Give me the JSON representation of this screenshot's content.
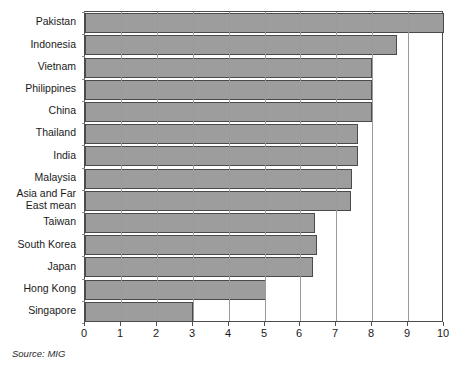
{
  "chart_data": {
    "type": "bar",
    "orientation": "horizontal",
    "title": "",
    "subtitle": "",
    "xlabel": "",
    "ylabel": "",
    "xlim": [
      0,
      10
    ],
    "ylim": null,
    "grid": "vertical-gridlines-at-integer-ticks",
    "legend": null,
    "legend_position": "none",
    "xticks": [
      "0",
      "1",
      "2",
      "3",
      "4",
      "5",
      "6",
      "7",
      "8",
      "9",
      "10"
    ],
    "xtick_values": [
      0,
      1,
      2,
      3,
      4,
      5,
      6,
      7,
      8,
      9,
      10
    ],
    "categories": [
      "Pakistan",
      "Indonesia",
      "Vietnam",
      "Philippines",
      "China",
      "Thailand",
      "India",
      "Malaysia",
      "Asia and Far\nEast mean",
      "Taiwan",
      "South Korea",
      "Japan",
      "Hong Kong",
      "Singapore"
    ],
    "values": [
      10.0,
      8.7,
      8.0,
      8.0,
      8.0,
      7.6,
      7.6,
      7.45,
      7.4,
      6.4,
      6.45,
      6.35,
      5.05,
      3.0
    ],
    "annotations": [
      "Source: MIG"
    ],
    "colors": {
      "bar_fill": "#9d9d9d",
      "bar_border": "#4a4a4a",
      "gridline": "#9a9a9a",
      "frame": "#4d4d4d",
      "text": "#1a1a1a",
      "background": "#ffffff"
    }
  },
  "source": {
    "label": "Source: MIG"
  }
}
